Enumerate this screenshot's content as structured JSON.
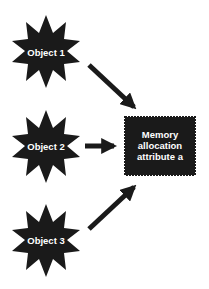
{
  "diagram": {
    "objects": [
      {
        "id": "object-1",
        "label": "Object 1"
      },
      {
        "id": "object-2",
        "label": "Object 2"
      },
      {
        "id": "object-3",
        "label": "Object 3"
      }
    ],
    "target": {
      "lines": [
        "Memory",
        "allocation",
        "attribute a"
      ]
    },
    "colors": {
      "shape_fill": "#1a1a1a",
      "text": "#ffffff",
      "background": "#ffffff"
    }
  }
}
